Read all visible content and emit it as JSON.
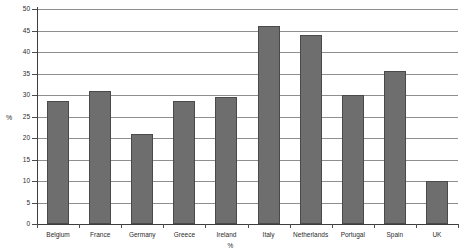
{
  "chart_data": {
    "type": "bar",
    "title": "",
    "subtitle": "",
    "xlabel": "%",
    "ylabel": "%",
    "categories": [
      "Belgium",
      "France",
      "Germany",
      "Greece",
      "Ireland",
      "Italy",
      "Netherlands",
      "Portugal",
      "Spain",
      "UK"
    ],
    "values": [
      28.5,
      31,
      21,
      28.5,
      29.5,
      46,
      44,
      30,
      35.5,
      10
    ],
    "series": [
      {
        "name": "Percentage",
        "values": [
          28.5,
          31,
          21,
          28.5,
          29.5,
          46,
          44,
          30,
          35.5,
          10
        ]
      }
    ],
    "ylim": [
      0,
      50
    ],
    "ytick_labels": [
      "0",
      "5",
      "10",
      "15",
      "20",
      "25",
      "30",
      "35",
      "40",
      "45",
      "50"
    ],
    "ytick_values": [
      0,
      5,
      10,
      15,
      20,
      25,
      30,
      35,
      40,
      45,
      50
    ],
    "grid": true,
    "grid_axis": "y",
    "legend": false,
    "legend_position": "none",
    "bar_color": "#6e6e6e",
    "bar_edge_color": "#4a4a4a",
    "grid_color": "#8e8e8e",
    "axis_color": "#3d3d3d",
    "background_color": "#ffffff",
    "text_color": "#2b2b2b"
  }
}
